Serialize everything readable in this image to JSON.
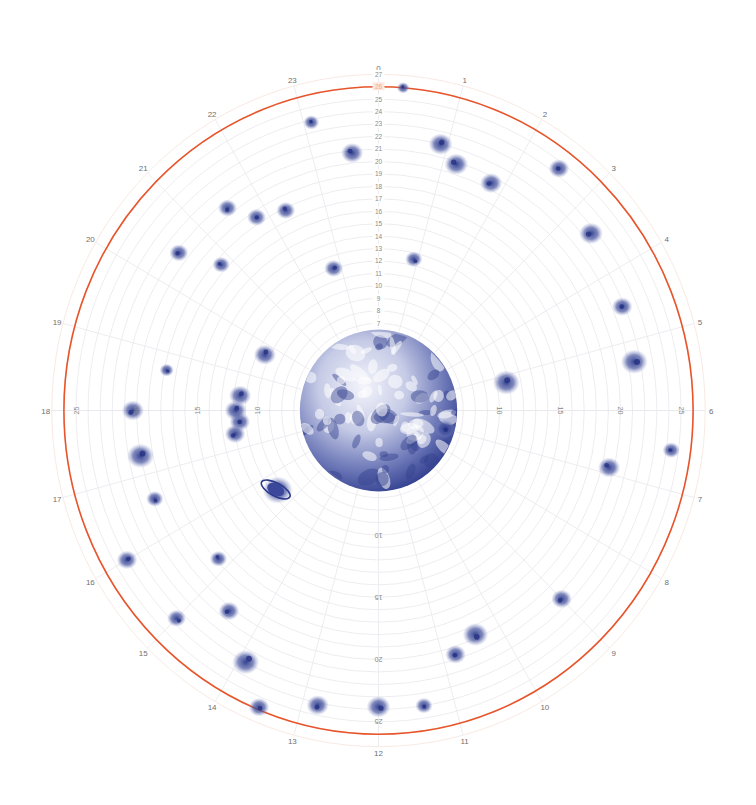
{
  "chart_data": {
    "type": "polar-scatter",
    "title": "",
    "center_px": [
      378.5,
      410.5
    ],
    "unit_px": {
      "x": 12.1,
      "y": 12.45
    },
    "angular_axis": {
      "labels": [
        "0",
        "1",
        "2",
        "3",
        "4",
        "5",
        "6",
        "7",
        "8",
        "9",
        "10",
        "11",
        "12",
        "13",
        "14",
        "15",
        "16",
        "17",
        "18",
        "19",
        "20",
        "21",
        "22",
        "23"
      ],
      "unit": "hour",
      "direction": "clockwise",
      "zero_at": "top",
      "label_radius": 27.5,
      "spokes": 24
    },
    "radial_axis": {
      "range": [
        0,
        27
      ],
      "rings": 27,
      "top_labels": [
        "7",
        "8",
        "9",
        "10",
        "11",
        "12",
        "13",
        "14",
        "15",
        "16",
        "17",
        "18",
        "19",
        "20",
        "21",
        "22",
        "23",
        "24",
        "25",
        "26",
        "27"
      ],
      "highlighted_label": "26",
      "right_labels": [
        "5",
        "10",
        "15",
        "20",
        "25"
      ],
      "left_labels": [
        "10",
        "15",
        "20",
        "25"
      ],
      "bottom_labels": [
        "10",
        "15",
        "20",
        "25"
      ],
      "grid": true
    },
    "reference_ring": {
      "radius": 26,
      "color": "#e8552b"
    },
    "center_object": {
      "name": "Earth",
      "radius": 6.5
    },
    "series": [
      {
        "name": "objects",
        "points": [
          {
            "hour": 0.3,
            "r": 26.0,
            "size": 0.3
          },
          {
            "hour": 0.9,
            "r": 22.0,
            "size": 1.0
          },
          {
            "hour": 1.2,
            "r": 20.8,
            "size": 1.0
          },
          {
            "hour": 1.8,
            "r": 20.5,
            "size": 0.9
          },
          {
            "hour": 2.5,
            "r": 24.5,
            "size": 0.8
          },
          {
            "hour": 3.4,
            "r": 22.6,
            "size": 1.0
          },
          {
            "hour": 0.9,
            "r": 12.5,
            "size": 0.6
          },
          {
            "hour": 4.5,
            "r": 21.8,
            "size": 0.8
          },
          {
            "hour": 5.2,
            "r": 10.8,
            "size": 1.2
          },
          {
            "hour": 5.3,
            "r": 21.5,
            "size": 1.2
          },
          {
            "hour": 6.5,
            "r": 24.4,
            "size": 0.6
          },
          {
            "hour": 6.9,
            "r": 19.6,
            "size": 0.9
          },
          {
            "hour": 7.0,
            "r": 5.7,
            "size": 0.8
          },
          {
            "hour": 9.0,
            "r": 21.4,
            "size": 0.8
          },
          {
            "hour": 10.4,
            "r": 19.7,
            "size": 1.1
          },
          {
            "hour": 10.8,
            "r": 20.6,
            "size": 0.8
          },
          {
            "hour": 11.4,
            "r": 24.0,
            "size": 0.6
          },
          {
            "hour": 12.0,
            "r": 23.8,
            "size": 1.0
          },
          {
            "hour": 12.8,
            "r": 24.2,
            "size": 0.9
          },
          {
            "hour": 13.5,
            "r": 25.8,
            "size": 0.8
          },
          {
            "hour": 13.9,
            "r": 23.0,
            "size": 1.2
          },
          {
            "hour": 14.5,
            "r": 20.3,
            "size": 0.8
          },
          {
            "hour": 15.0,
            "r": 23.6,
            "size": 0.7
          },
          {
            "hour": 15.2,
            "r": 17.8,
            "size": 0.6
          },
          {
            "hour": 16.0,
            "r": 24.0,
            "size": 0.8
          },
          {
            "hour": 16.6,
            "r": 19.8,
            "size": 0.6
          },
          {
            "hour": 15.5,
            "r": 10.5,
            "size": 1.4
          },
          {
            "hour": 17.3,
            "r": 20.0,
            "size": 1.2
          },
          {
            "hour": 18.0,
            "r": 20.3,
            "size": 0.9
          },
          {
            "hour": 18.7,
            "r": 17.8,
            "size": 0.4
          },
          {
            "hour": 17.7,
            "r": 11.5,
            "size": 0.8
          },
          {
            "hour": 18.0,
            "r": 11.8,
            "size": 0.9
          },
          {
            "hour": 18.4,
            "r": 11.5,
            "size": 0.9
          },
          {
            "hour": 17.4,
            "r": 12.0,
            "size": 0.8
          },
          {
            "hour": 19.7,
            "r": 10.4,
            "size": 0.9
          },
          {
            "hour": 20.5,
            "r": 20.8,
            "size": 0.7
          },
          {
            "hour": 20.8,
            "r": 17.5,
            "size": 0.6
          },
          {
            "hour": 21.5,
            "r": 20.5,
            "size": 0.7
          },
          {
            "hour": 21.8,
            "r": 18.5,
            "size": 0.7
          },
          {
            "hour": 22.8,
            "r": 12.0,
            "size": 0.7
          },
          {
            "hour": 22.3,
            "r": 17.8,
            "size": 0.7
          },
          {
            "hour": 23.6,
            "r": 20.8,
            "size": 0.9
          },
          {
            "hour": 23.1,
            "r": 23.8,
            "size": 0.5
          }
        ]
      }
    ],
    "colors": {
      "ink": "#2c3a8c",
      "grid": "#e9e9ee",
      "reference_ring": "#e8552b",
      "label": "#777777"
    }
  }
}
